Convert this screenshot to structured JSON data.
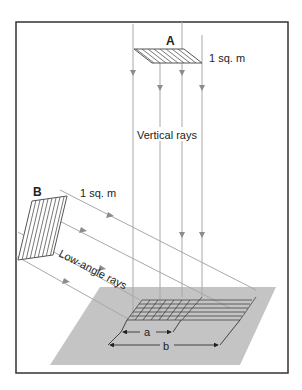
{
  "diagram": {
    "colors": {
      "frame": "#333333",
      "ray": "#a8a8a8",
      "arrowhead": "#8c8c8c",
      "ground": "#c4c4c4",
      "grid": "#444444",
      "hatch": "#555555"
    },
    "panel_a": {
      "label": "A",
      "area_label": "1 sq. m"
    },
    "panel_b": {
      "label": "B",
      "area_label": "1 sq. m"
    },
    "vertical_rays_label": "Vertical rays",
    "low_angle_rays_label": "Low-angle rays",
    "dimension_a": "a",
    "dimension_b": "b"
  }
}
